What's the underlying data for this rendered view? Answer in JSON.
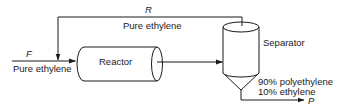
{
  "diagram": {
    "type": "process-flow",
    "colors": {
      "line": "#1a1a1a",
      "background": "#ffffff"
    },
    "streams": {
      "feed": {
        "symbol": "F",
        "composition": "Pure ethylene"
      },
      "recycle": {
        "symbol": "R",
        "composition": "Pure ethylene"
      },
      "product": {
        "symbol": "P",
        "composition_line1": "90% polyethylene",
        "composition_line2": "10% ethylene"
      }
    },
    "units": {
      "reactor": {
        "label": "Reactor"
      },
      "separator": {
        "label": "Separator"
      }
    }
  }
}
